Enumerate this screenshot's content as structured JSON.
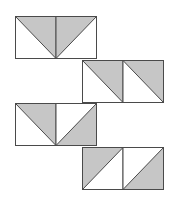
{
  "diagram": {
    "colors": {
      "fill": "#c6c6c6",
      "stroke": "#4a4a4a",
      "background": "#ffffff"
    },
    "blocks": [
      {
        "id": "block-1",
        "x": 15,
        "y": 16,
        "squares": [
          "down-right",
          "down-left"
        ]
      },
      {
        "id": "block-2",
        "x": 82,
        "y": 60,
        "squares": [
          "down-right",
          "down-right"
        ]
      },
      {
        "id": "block-3",
        "x": 15,
        "y": 103,
        "squares": [
          "down-right",
          "up-right"
        ]
      },
      {
        "id": "block-4",
        "x": 82,
        "y": 147,
        "squares": [
          "up-left",
          "up-right"
        ]
      }
    ],
    "square_size": {
      "w": 40.5,
      "h": 42
    }
  }
}
